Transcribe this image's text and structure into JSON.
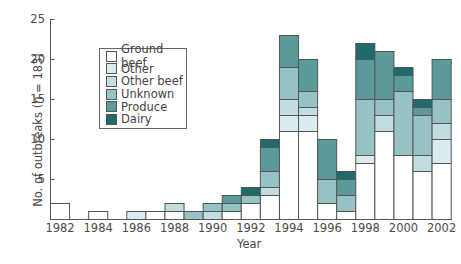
{
  "chart_data": {
    "type": "bar",
    "stacked": true,
    "title": "",
    "xlabel": "Year",
    "ylabel": "No. of outbreaks (n = 183)",
    "ylim": [
      0,
      25
    ],
    "yticks": [
      5,
      10,
      15,
      20,
      25
    ],
    "xtick_labels": [
      "1982",
      "1984",
      "1986",
      "1988",
      "1990",
      "1992",
      "1994",
      "1996",
      "1998",
      "2000",
      "2002"
    ],
    "grid": false,
    "legend_position": "upper left (inside)",
    "categories": [
      "1982",
      "1983",
      "1984",
      "1985",
      "1986",
      "1987",
      "1988",
      "1989",
      "1990",
      "1991",
      "1992",
      "1993",
      "1994",
      "1995",
      "1996",
      "1997",
      "1998",
      "1999",
      "2000",
      "2001",
      "2002"
    ],
    "series": [
      {
        "name": "Ground beef",
        "color": "#ffffff",
        "values": [
          2,
          0,
          1,
          0,
          0,
          1,
          1,
          0,
          0,
          1,
          2,
          3,
          11,
          11,
          2,
          1,
          7,
          11,
          8,
          6,
          7
        ]
      },
      {
        "name": "Other",
        "color": "#dcecee",
        "values": [
          0,
          0,
          0,
          0,
          1,
          0,
          0,
          0,
          0,
          0,
          0,
          0,
          2,
          2,
          0,
          0,
          1,
          0,
          0,
          0,
          3
        ]
      },
      {
        "name": "Other beef",
        "color": "#c2dcdf",
        "values": [
          0,
          0,
          0,
          0,
          0,
          0,
          1,
          0,
          1,
          0,
          0,
          1,
          2,
          1,
          0,
          0,
          0,
          2,
          0,
          2,
          2
        ]
      },
      {
        "name": "Unknown",
        "color": "#98c3c5",
        "values": [
          0,
          0,
          0,
          0,
          0,
          0,
          0,
          1,
          1,
          1,
          1,
          2,
          4,
          2,
          3,
          2,
          7,
          2,
          8,
          5,
          3
        ]
      },
      {
        "name": "Produce",
        "color": "#5a9a9b",
        "values": [
          0,
          0,
          0,
          0,
          0,
          0,
          0,
          0,
          0,
          1,
          0,
          3,
          4,
          4,
          5,
          2,
          5,
          6,
          2,
          1,
          5
        ]
      },
      {
        "name": "Dairy",
        "color": "#1f6a6a",
        "values": [
          0,
          0,
          0,
          0,
          0,
          0,
          0,
          0,
          0,
          0,
          1,
          1,
          0,
          0,
          0,
          1,
          2,
          0,
          1,
          1,
          0
        ]
      }
    ],
    "totals": [
      2,
      0,
      1,
      0,
      1,
      1,
      2,
      1,
      2,
      3,
      4,
      10,
      23,
      20,
      10,
      6,
      22,
      21,
      19,
      15,
      20
    ]
  },
  "legend": {
    "items": [
      {
        "label": "Ground beef",
        "color": "#ffffff"
      },
      {
        "label": "Other",
        "color": "#dcecee"
      },
      {
        "label": "Other beef",
        "color": "#c2dcdf"
      },
      {
        "label": "Unknown",
        "color": "#98c3c5"
      },
      {
        "label": "Produce",
        "color": "#5a9a9b"
      },
      {
        "label": "Dairy",
        "color": "#1f6a6a"
      }
    ]
  },
  "axes": {
    "x_title": "Year",
    "y_title_prefix": "No. of outbreaks (",
    "y_title_var": "n",
    "y_title_suffix": " = 183)"
  }
}
